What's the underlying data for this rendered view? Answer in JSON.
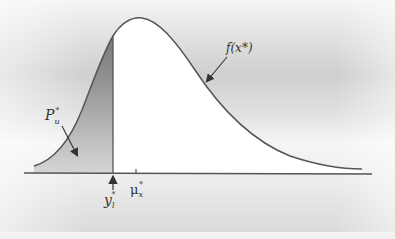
{
  "diagram": {
    "type": "probability-density-curve",
    "curve_label": "f(x*)",
    "shaded_area_label": {
      "base": "P",
      "sub": "u",
      "sup": "*"
    },
    "threshold_label": {
      "base": "y",
      "sub": "l",
      "sup": "*"
    },
    "mean_label": {
      "base": "μ",
      "sub": "x",
      "sup": "*"
    },
    "colors": {
      "curve": "#555555",
      "axis": "#555555",
      "area_fill": "#ffffff",
      "shaded_fill_top": "#6e6e6e",
      "shaded_fill_bottom": "#c8c8c8"
    }
  }
}
